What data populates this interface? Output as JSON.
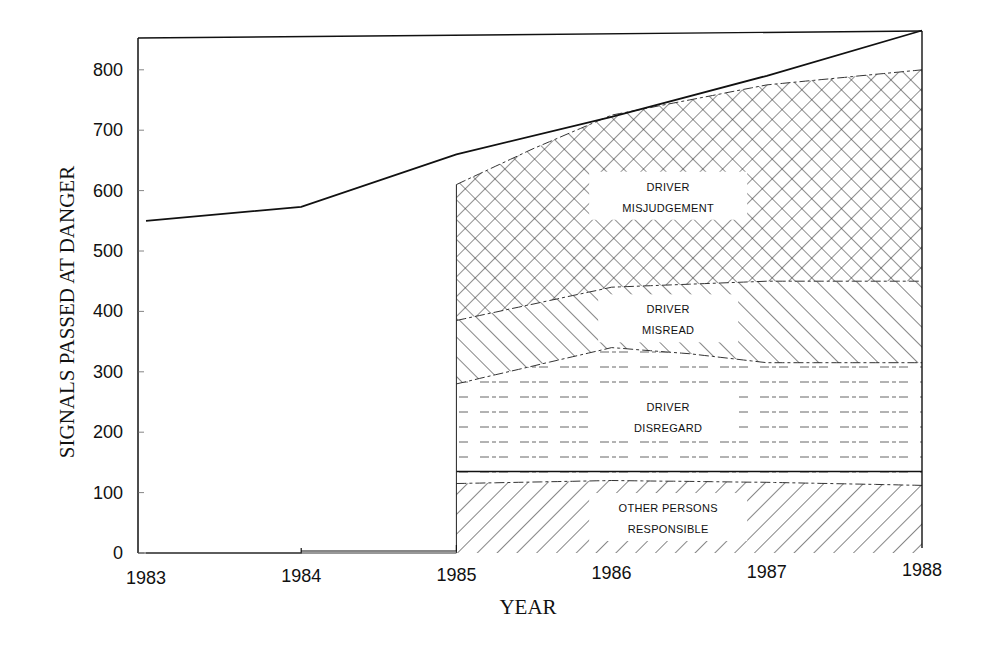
{
  "chart_data": {
    "type": "area",
    "title": "",
    "xlabel": "YEAR",
    "ylabel": "SIGNALS PASSED AT DANGER",
    "x_ticks": [
      "1983",
      "1984",
      "1985",
      "1986",
      "1987",
      "1988"
    ],
    "y_ticks": [
      "0",
      "100",
      "200",
      "300",
      "400",
      "500",
      "600",
      "700",
      "800"
    ],
    "xlim": [
      1983,
      1988
    ],
    "ylim": [
      0,
      860
    ],
    "grid": false,
    "stacked": true,
    "total_line": {
      "name": "Total",
      "x": [
        1983,
        1984,
        1985,
        1986,
        1987,
        1988
      ],
      "values": [
        550,
        573,
        660,
        722,
        790,
        865
      ]
    },
    "series": [
      {
        "name": "OTHER PERSONS RESPONSIBLE",
        "label_lines": [
          "OTHER PERSONS",
          "RESPONSIBLE"
        ],
        "pattern": "forward-diagonal-hatch",
        "x": [
          1985,
          1986,
          1987,
          1988
        ],
        "cumulative_top": [
          115,
          120,
          117,
          112
        ]
      },
      {
        "name": "DRIVER DISREGARD",
        "label_lines": [
          "DRIVER",
          "DISREGARD"
        ],
        "pattern": "horizontal-dashed-lines",
        "x": [
          1985,
          1985.5,
          1986,
          1986.5,
          1987,
          1988
        ],
        "cumulative_top": [
          280,
          310,
          340,
          330,
          315,
          315
        ]
      },
      {
        "name": "DRIVER MISREAD",
        "label_lines": [
          "DRIVER",
          "MISREAD"
        ],
        "pattern": "back-diagonal-hatch",
        "x": [
          1985,
          1986,
          1987,
          1988
        ],
        "cumulative_top": [
          385,
          440,
          450,
          450
        ]
      },
      {
        "name": "DRIVER MISJUDGEMENT",
        "label_lines": [
          "DRIVER",
          "MISJUDGEMENT"
        ],
        "pattern": "cross-hatch",
        "x": [
          1985,
          1985.5,
          1986,
          1987,
          1988
        ],
        "cumulative_top": [
          610,
          670,
          725,
          775,
          800
        ]
      }
    ],
    "separator_line": {
      "y": 135,
      "x": [
        1985,
        1988
      ]
    },
    "colors": {
      "ink": "#111111",
      "background": "#ffffff"
    }
  }
}
